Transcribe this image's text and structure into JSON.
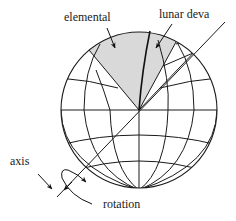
{
  "diagram": {
    "type": "globe-rotation-diagram",
    "colors": {
      "line": "#1a1a1a",
      "shaded_region": "#d9d9d9",
      "background": "#ffffff"
    },
    "labels": {
      "elemental": "elemental",
      "lunar_deva": "lunar deva",
      "axis": "axis",
      "rotation": "rotation"
    },
    "regions": [
      {
        "name": "elemental",
        "shaded": true
      },
      {
        "name": "lunar deva",
        "shaded": true
      }
    ]
  }
}
